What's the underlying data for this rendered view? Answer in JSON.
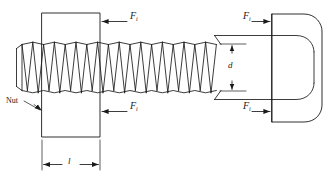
{
  "figure": {
    "type": "engineering-line-diagram",
    "background_color": "#ffffff",
    "line_color": "#1a1a1a"
  },
  "labels": {
    "force_top_left": {
      "symbol": "F",
      "subscript": "i",
      "text": "Fi"
    },
    "force_bottom_left": {
      "symbol": "F",
      "subscript": "i",
      "text": "Fi"
    },
    "force_top_right": {
      "symbol": "F",
      "subscript": "i",
      "text": "Fi"
    },
    "force_bottom_right": {
      "symbol": "F",
      "subscript": "i",
      "text": "Fi"
    },
    "diameter": {
      "symbol": "d",
      "text": "d"
    },
    "grip_length": {
      "symbol": "l",
      "text": "l"
    },
    "nut": {
      "text": "Nut"
    }
  },
  "components": {
    "nut_block": "rectangular nut shown in section, clamped on threaded shank",
    "threaded_shank": "helical screw thread profile drawn as zigzag crests and roots",
    "plain_shank": "unthreaded cylindrical shank between thread runout and head",
    "bolt_head": "hexagonal head with chamfer arcs, drawn across flats"
  },
  "annotations": {
    "arrow_force_top_left": "arrow pointing left into nut right face, labeled Fi",
    "arrow_force_bottom_left": "arrow pointing left into nut right face, labeled Fi",
    "arrow_force_top_right": "arrow pointing right into bolt head left face, labeled Fi",
    "arrow_force_bottom_right": "arrow pointing right into bolt head left face, labeled Fi",
    "dimension_d": "vertical double arrow across shank diameter, labeled d",
    "dimension_l": "horizontal double arrow across nut width, labeled l",
    "leader_nut": "leader line from text Nut to the nut block outline"
  }
}
